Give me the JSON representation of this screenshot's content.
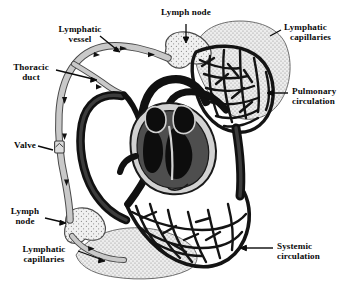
{
  "figure": {
    "background_color": "#ffffff",
    "ink_color": "#0a0a0a",
    "vessel_gray": "#9a9a9a",
    "stipple_gray": "#d8d8d8",
    "muscle_gray": "#565656"
  },
  "labels": {
    "lymph_node_top": {
      "line1": "Lymph node"
    },
    "lymphatic_capillaries_top": {
      "line1": "Lymphatic",
      "line2": "capillaries"
    },
    "lymphatic_vessel": {
      "line1": "Lymphatic",
      "line2": "vessel"
    },
    "thoracic_duct": {
      "line1": "Thoracic",
      "line2": "duct"
    },
    "pulmonary_circulation": {
      "line1": "Pulmonary",
      "line2": "circulation"
    },
    "valve": {
      "line1": "Valve"
    },
    "lymph_node_bottom": {
      "line1": "Lymph",
      "line2": "node"
    },
    "lymphatic_capillaries_bottom": {
      "line1": "Lymphatic",
      "line2": "capillaries"
    },
    "systemic_circulation": {
      "line1": "Systemic",
      "line2": "circulation"
    }
  },
  "structures": {
    "heart": "heart-cross-section",
    "pulmonary_bed": "pulmonary-capillary-network",
    "systemic_bed": "systemic-capillary-network",
    "lymph_nodes": 2,
    "valves": 1
  }
}
